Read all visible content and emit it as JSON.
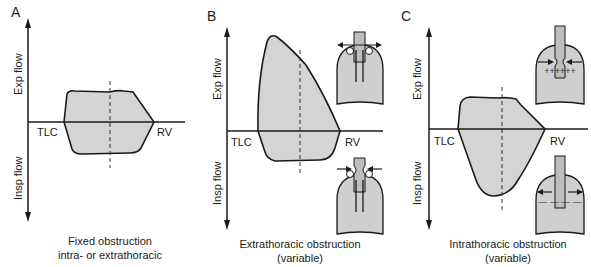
{
  "figure": {
    "colors": {
      "fill": "#d4d4d4",
      "stroke": "#1a1a1a",
      "background": "#ffffff"
    }
  },
  "panels": [
    {
      "label": "A",
      "y_axis_top": "Exp flow",
      "y_axis_bottom": "Insp flow",
      "x_left": "TLC",
      "x_right": "RV",
      "caption_line1": "Fixed obstruction",
      "caption_line2": "intra- or extrathoracic",
      "shape": "plateaued expiratory and inspiratory limbs (flattened loop)"
    },
    {
      "label": "B",
      "y_axis_top": "Exp flow",
      "y_axis_bottom": "Insp flow",
      "x_left": "TLC",
      "x_right": "RV",
      "caption_line1": "Extrathoracic obstruction",
      "caption_line2": "(variable)",
      "shape": "normal expiratory peak, flattened inspiratory limb",
      "insets": [
        "airway dilates on expiration (arrows outward)",
        "airway narrows on inspiration (arrows inward)"
      ]
    },
    {
      "label": "C",
      "y_axis_top": "Exp flow",
      "y_axis_bottom": "Insp flow",
      "x_left": "TLC",
      "x_right": "RV",
      "caption_line1": "Intrathoracic obstruction",
      "caption_line2": "(variable)",
      "shape": "flattened expiratory limb, normal inspiratory limb",
      "insets": [
        "airway narrows on expiration with positive pleural pressure (+)",
        "airway dilates on inspiration with negative pleural pressure (−)"
      ]
    }
  ]
}
